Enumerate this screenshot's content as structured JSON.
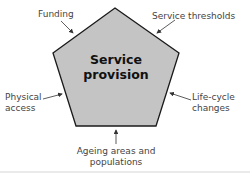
{
  "diagram": {
    "center": {
      "line1": "Service",
      "line2": "provision"
    },
    "shape": "pentagon",
    "fill_color": "#c4c4c4",
    "stroke_color": "#1a1a1a",
    "factors": [
      {
        "id": "funding",
        "label": "Funding"
      },
      {
        "id": "service-thresholds",
        "label": "Service thresholds"
      },
      {
        "id": "physical-access",
        "line1": "Physical",
        "line2": "access"
      },
      {
        "id": "life-cycle-changes",
        "line1": "Life-cycle",
        "line2": "changes"
      },
      {
        "id": "ageing-areas",
        "line1": "Ageing areas and",
        "line2": "populations"
      }
    ]
  }
}
